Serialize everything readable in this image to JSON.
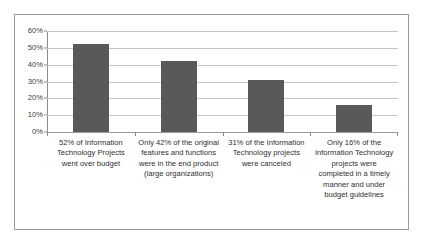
{
  "chart_data": {
    "type": "bar",
    "title": "",
    "subtitle": "",
    "xlabel": "",
    "ylabel": "",
    "ylim": [
      0,
      60
    ],
    "y_tick_format": "percent",
    "grid": true,
    "legend": false,
    "legend_position": "none",
    "bar_color": "#595959",
    "categories": [
      "52% of Information Technology Projects went over budget",
      "Only 42% of the original features and functions were in the end product (large organizations)",
      "31% of the Information Technology projects were canceled",
      "Only 16% of the Information Technology projects were completed in a timely manner and under budget guidelines"
    ],
    "values": [
      52,
      42,
      31,
      16
    ],
    "y_ticks": [
      "0%",
      "10%",
      "20%",
      "30%",
      "40%",
      "50%",
      "60%"
    ],
    "y_tick_values": [
      0,
      10,
      20,
      30,
      40,
      50,
      60
    ]
  },
  "colors": {
    "bar": "#595959",
    "gridline": "#c4c4c4",
    "axis": "#8c8c8c",
    "frame": "#9a9a9a",
    "text": "#2f2f2f",
    "background": "#ffffff"
  }
}
